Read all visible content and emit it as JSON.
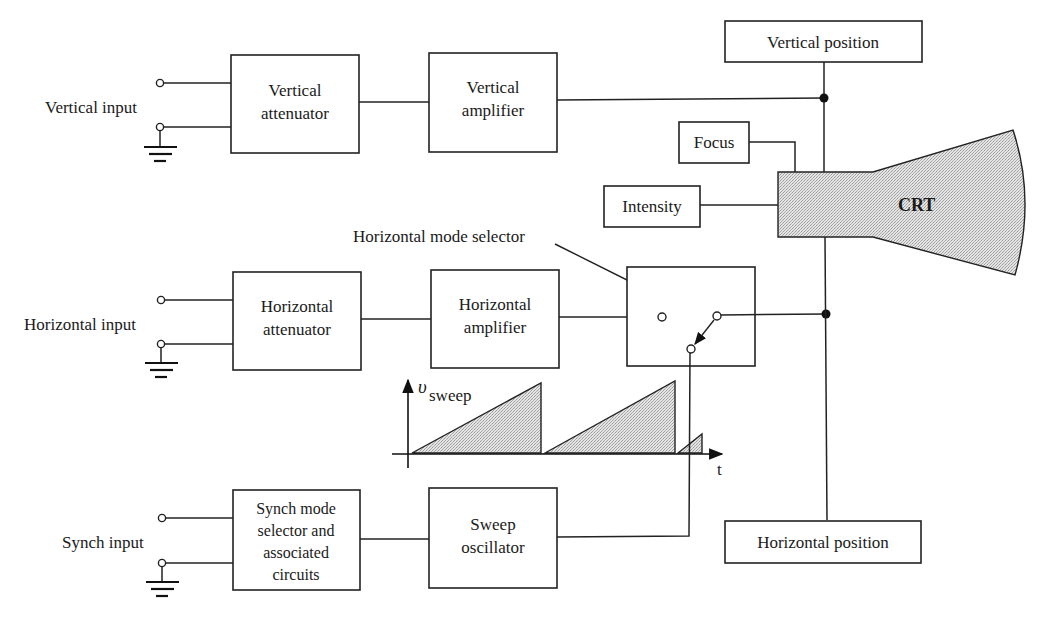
{
  "diagram": {
    "inputs": {
      "vertical": "Vertical input",
      "horizontal": "Horizontal input",
      "synch": "Synch input"
    },
    "blocks": {
      "vertical_attenuator": [
        "Vertical",
        "attenuator"
      ],
      "vertical_amplifier": [
        "Vertical",
        "amplifier"
      ],
      "vertical_position": "Vertical position",
      "focus": "Focus",
      "intensity": "Intensity",
      "crt": "CRT",
      "horizontal_attenuator": [
        "Horizontal",
        "attenuator"
      ],
      "horizontal_amplifier": [
        "Horizontal",
        "amplifier"
      ],
      "horizontal_mode_selector": "Horizontal mode selector",
      "synch_mode_selector": [
        "Synch mode",
        "selector and",
        "associated",
        "circuits"
      ],
      "sweep_oscillator": [
        "Sweep",
        "oscillator"
      ],
      "horizontal_position": "Horizontal position"
    },
    "sweep_graph": {
      "y_label_main": "υ",
      "y_label_sub": "sweep",
      "x_label": "t",
      "waveform": "sawtooth"
    },
    "colors": {
      "line": "#222222",
      "fill_shade": "#d8d8d8",
      "background": "#ffffff"
    }
  }
}
